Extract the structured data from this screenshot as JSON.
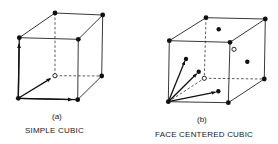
{
  "figure": {
    "panels": [
      {
        "id": "a",
        "sublabel": "(a)",
        "title": "SIMPLE CUBIC",
        "lattice": "simple cubic",
        "atoms": {
          "corner_filled": 7,
          "corner_open": 1
        },
        "vectors": 3
      },
      {
        "id": "b",
        "sublabel": "(b)",
        "title": "FACE CENTERED CUBIC",
        "lattice": "face centered cubic",
        "atoms": {
          "corner_filled": 7,
          "corner_open": 1,
          "face_centers_filled": 5,
          "face_centers_open": 1
        },
        "vectors": 3
      }
    ],
    "colors": {
      "ink": "#111111",
      "background": "#ffffff"
    }
  }
}
